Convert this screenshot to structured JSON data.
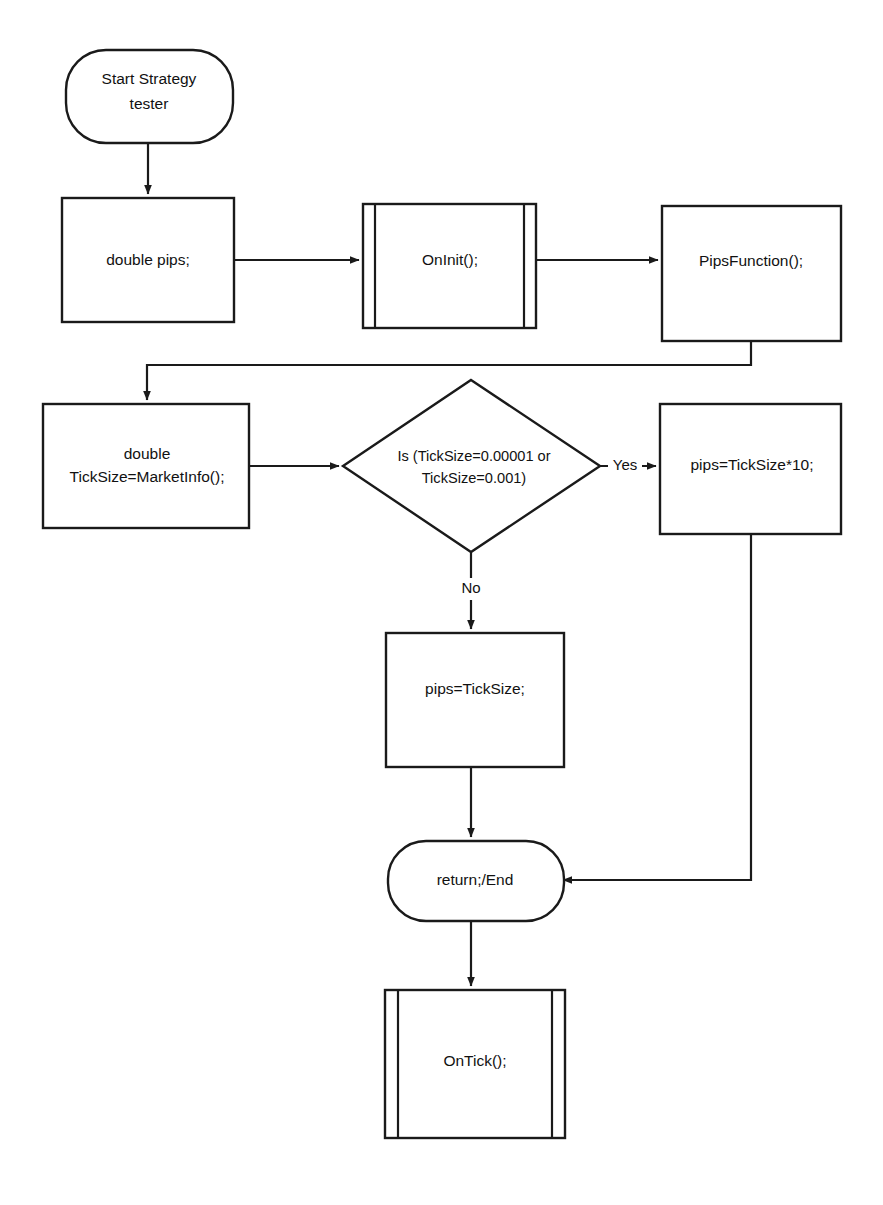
{
  "diagram": {
    "type": "flowchart",
    "background_color": "#ffffff",
    "stroke_color": "#1a1a1a",
    "text_color": "#111111",
    "nodes": [
      {
        "id": "start",
        "shape": "stadium",
        "label_line1": "Start Strategy",
        "label_line2": "tester"
      },
      {
        "id": "double-pips",
        "shape": "process",
        "label_line1": "double pips;",
        "label_line2": ""
      },
      {
        "id": "oninit",
        "shape": "subroutine",
        "label_line1": "OnInit();",
        "label_line2": ""
      },
      {
        "id": "pipsfunction",
        "shape": "process",
        "label_line1": "PipsFunction();",
        "label_line2": ""
      },
      {
        "id": "ticksize",
        "shape": "process",
        "label_line1": "double",
        "label_line2": "TickSize=MarketInfo();"
      },
      {
        "id": "decision",
        "shape": "decision",
        "label_line1": "Is (TickSize=0.00001 or",
        "label_line2": "TickSize=0.001)"
      },
      {
        "id": "pips-times-ten",
        "shape": "process",
        "label_line1": "pips=TickSize*10;",
        "label_line2": ""
      },
      {
        "id": "pips-equals-ticksize",
        "shape": "process",
        "label_line1": "pips=TickSize;",
        "label_line2": ""
      },
      {
        "id": "return-end",
        "shape": "stadium",
        "label_line1": "return;/End",
        "label_line2": ""
      },
      {
        "id": "ontick",
        "shape": "subroutine",
        "label_line1": "OnTick();",
        "label_line2": ""
      }
    ],
    "edge_labels": {
      "yes": "Yes",
      "no": "No"
    },
    "edges": [
      {
        "from": "start",
        "to": "double-pips",
        "label": ""
      },
      {
        "from": "double-pips",
        "to": "oninit",
        "label": ""
      },
      {
        "from": "oninit",
        "to": "pipsfunction",
        "label": ""
      },
      {
        "from": "pipsfunction",
        "to": "ticksize",
        "label": ""
      },
      {
        "from": "ticksize",
        "to": "decision",
        "label": ""
      },
      {
        "from": "decision",
        "to": "pips-times-ten",
        "label": "Yes"
      },
      {
        "from": "decision",
        "to": "pips-equals-ticksize",
        "label": "No"
      },
      {
        "from": "pips-equals-ticksize",
        "to": "return-end",
        "label": ""
      },
      {
        "from": "pips-times-ten",
        "to": "return-end",
        "label": ""
      },
      {
        "from": "return-end",
        "to": "ontick",
        "label": ""
      }
    ]
  }
}
